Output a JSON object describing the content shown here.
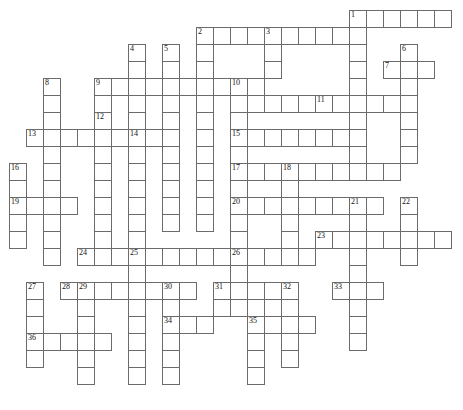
{
  "puzzle": {
    "title": "Crossword Puzzle Grid",
    "type": "crossword-grid",
    "cell_size": 17,
    "origin_x": 9,
    "origin_y": 10,
    "grid_columns": 27,
    "grid_rows": 24,
    "colors": {
      "cell_border": "#6b6b6b",
      "cell_fill": "#ffffff",
      "number_text": "#111111",
      "background": "#ffffff"
    },
    "clue_numbers": [
      1,
      2,
      3,
      4,
      5,
      6,
      7,
      8,
      9,
      10,
      11,
      12,
      13,
      14,
      15,
      16,
      17,
      18,
      19,
      20,
      21,
      22,
      23,
      24,
      25,
      26,
      27,
      28,
      29,
      30,
      31,
      32,
      33,
      34,
      35,
      36
    ],
    "entries": [
      {
        "number": 1,
        "direction": "across",
        "row": 0,
        "col": 20,
        "length": 6
      },
      {
        "number": 1,
        "direction": "down",
        "row": 0,
        "col": 20,
        "length": 8
      },
      {
        "number": 2,
        "direction": "across",
        "row": 1,
        "col": 11,
        "length": 9
      },
      {
        "number": 2,
        "direction": "down",
        "row": 1,
        "col": 11,
        "length": 8
      },
      {
        "number": 3,
        "direction": "down",
        "row": 1,
        "col": 15,
        "length": 3
      },
      {
        "number": 4,
        "direction": "down",
        "row": 2,
        "col": 7,
        "length": 5
      },
      {
        "number": 5,
        "direction": "down",
        "row": 2,
        "col": 9,
        "length": 8
      },
      {
        "number": 6,
        "direction": "down",
        "row": 2,
        "col": 23,
        "length": 8
      },
      {
        "number": 7,
        "direction": "across",
        "row": 3,
        "col": 22,
        "length": 3
      },
      {
        "number": 8,
        "direction": "down",
        "row": 4,
        "col": 2,
        "length": 12
      },
      {
        "number": 9,
        "direction": "across",
        "row": 4,
        "col": 5,
        "length": 10
      },
      {
        "number": 10,
        "direction": "across",
        "row": 4,
        "col": 13,
        "length": 5
      },
      {
        "number": 10,
        "direction": "down",
        "row": 4,
        "col": 13,
        "length": 14
      },
      {
        "number": 11,
        "direction": "across",
        "row": 5,
        "col": 18,
        "length": 5
      },
      {
        "number": 12,
        "direction": "down",
        "row": 6,
        "col": 5,
        "length": 12
      },
      {
        "number": 13,
        "direction": "across",
        "row": 7,
        "col": 1,
        "length": 8
      },
      {
        "number": 14,
        "direction": "down",
        "row": 7,
        "col": 7,
        "length": 7
      },
      {
        "number": 15,
        "direction": "across",
        "row": 7,
        "col": 13,
        "length": 7
      },
      {
        "number": 16,
        "direction": "down",
        "row": 9,
        "col": 0,
        "length": 4
      },
      {
        "number": 17,
        "direction": "across",
        "row": 9,
        "col": 13,
        "length": 10
      },
      {
        "number": 18,
        "direction": "down",
        "row": 9,
        "col": 16,
        "length": 7
      },
      {
        "number": 19,
        "direction": "across",
        "row": 11,
        "col": 0,
        "length": 4
      },
      {
        "number": 20,
        "direction": "across",
        "row": 11,
        "col": 13,
        "length": 8
      },
      {
        "number": 21,
        "direction": "down",
        "row": 11,
        "col": 20,
        "length": 8
      },
      {
        "number": 22,
        "direction": "down",
        "row": 11,
        "col": 23,
        "length": 5
      },
      {
        "number": 23,
        "direction": "across",
        "row": 13,
        "col": 18,
        "length": 8
      },
      {
        "number": 24,
        "direction": "across",
        "row": 14,
        "col": 4,
        "length": 10
      },
      {
        "number": 25,
        "direction": "down",
        "row": 14,
        "col": 7,
        "length": 10
      },
      {
        "number": 26,
        "direction": "across",
        "row": 14,
        "col": 13,
        "length": 5
      },
      {
        "number": 26,
        "direction": "down",
        "row": 14,
        "col": 13,
        "length": 6
      },
      {
        "number": 27,
        "direction": "down",
        "row": 16,
        "col": 1,
        "length": 6
      },
      {
        "number": 28,
        "direction": "across",
        "row": 16,
        "col": 3,
        "length": 8
      },
      {
        "number": 29,
        "direction": "down",
        "row": 16,
        "col": 4,
        "length": 8
      },
      {
        "number": 30,
        "direction": "down",
        "row": 16,
        "col": 9,
        "length": 8
      },
      {
        "number": 31,
        "direction": "across",
        "row": 16,
        "col": 12,
        "length": 4
      },
      {
        "number": 32,
        "direction": "down",
        "row": 16,
        "col": 16,
        "length": 6
      },
      {
        "number": 33,
        "direction": "across",
        "row": 16,
        "col": 19,
        "length": 3
      },
      {
        "number": 34,
        "direction": "across",
        "row": 18,
        "col": 9,
        "length": 3
      },
      {
        "number": 35,
        "direction": "across",
        "row": 18,
        "col": 14,
        "length": 4
      },
      {
        "number": 35,
        "direction": "down",
        "row": 18,
        "col": 14,
        "length": 5
      },
      {
        "number": 36,
        "direction": "across",
        "row": 19,
        "col": 1,
        "length": 5
      }
    ],
    "cells": [
      {
        "r": 0,
        "c": 20,
        "n": 1
      },
      {
        "r": 0,
        "c": 21
      },
      {
        "r": 0,
        "c": 22
      },
      {
        "r": 0,
        "c": 23
      },
      {
        "r": 0,
        "c": 24
      },
      {
        "r": 0,
        "c": 25
      },
      {
        "r": 1,
        "c": 11,
        "n": 2
      },
      {
        "r": 1,
        "c": 12
      },
      {
        "r": 1,
        "c": 13
      },
      {
        "r": 1,
        "c": 14
      },
      {
        "r": 1,
        "c": 15,
        "n": 3
      },
      {
        "r": 1,
        "c": 16
      },
      {
        "r": 1,
        "c": 17
      },
      {
        "r": 1,
        "c": 18
      },
      {
        "r": 1,
        "c": 19
      },
      {
        "r": 1,
        "c": 20
      },
      {
        "r": 2,
        "c": 7,
        "n": 4
      },
      {
        "r": 2,
        "c": 9,
        "n": 5
      },
      {
        "r": 2,
        "c": 11
      },
      {
        "r": 2,
        "c": 15
      },
      {
        "r": 2,
        "c": 20
      },
      {
        "r": 2,
        "c": 23,
        "n": 6
      },
      {
        "r": 3,
        "c": 7
      },
      {
        "r": 3,
        "c": 9
      },
      {
        "r": 3,
        "c": 11
      },
      {
        "r": 3,
        "c": 15
      },
      {
        "r": 3,
        "c": 20
      },
      {
        "r": 3,
        "c": 22,
        "n": 7
      },
      {
        "r": 3,
        "c": 23
      },
      {
        "r": 3,
        "c": 24
      },
      {
        "r": 4,
        "c": 2,
        "n": 8
      },
      {
        "r": 4,
        "c": 5,
        "n": 9
      },
      {
        "r": 4,
        "c": 6
      },
      {
        "r": 4,
        "c": 7
      },
      {
        "r": 4,
        "c": 8
      },
      {
        "r": 4,
        "c": 9
      },
      {
        "r": 4,
        "c": 10
      },
      {
        "r": 4,
        "c": 11
      },
      {
        "r": 4,
        "c": 12
      },
      {
        "r": 4,
        "c": 13,
        "n": 10
      },
      {
        "r": 4,
        "c": 14
      },
      {
        "r": 4,
        "c": 20
      },
      {
        "r": 4,
        "c": 23
      },
      {
        "r": 5,
        "c": 2
      },
      {
        "r": 5,
        "c": 5
      },
      {
        "r": 5,
        "c": 7
      },
      {
        "r": 5,
        "c": 9
      },
      {
        "r": 5,
        "c": 11
      },
      {
        "r": 5,
        "c": 13
      },
      {
        "r": 5,
        "c": 14
      },
      {
        "r": 5,
        "c": 15
      },
      {
        "r": 5,
        "c": 16
      },
      {
        "r": 5,
        "c": 17
      },
      {
        "r": 5,
        "c": 18,
        "n": 11
      },
      {
        "r": 5,
        "c": 19
      },
      {
        "r": 5,
        "c": 20
      },
      {
        "r": 5,
        "c": 21
      },
      {
        "r": 5,
        "c": 22
      },
      {
        "r": 5,
        "c": 23
      },
      {
        "r": 6,
        "c": 2
      },
      {
        "r": 6,
        "c": 5,
        "n": 12
      },
      {
        "r": 6,
        "c": 7
      },
      {
        "r": 6,
        "c": 9
      },
      {
        "r": 6,
        "c": 11
      },
      {
        "r": 6,
        "c": 13
      },
      {
        "r": 6,
        "c": 20
      },
      {
        "r": 6,
        "c": 23
      },
      {
        "r": 7,
        "c": 1,
        "n": 13
      },
      {
        "r": 7,
        "c": 2
      },
      {
        "r": 7,
        "c": 3
      },
      {
        "r": 7,
        "c": 4
      },
      {
        "r": 7,
        "c": 5
      },
      {
        "r": 7,
        "c": 6
      },
      {
        "r": 7,
        "c": 7,
        "n": 14
      },
      {
        "r": 7,
        "c": 8
      },
      {
        "r": 7,
        "c": 9
      },
      {
        "r": 7,
        "c": 11
      },
      {
        "r": 7,
        "c": 13,
        "n": 15
      },
      {
        "r": 7,
        "c": 14
      },
      {
        "r": 7,
        "c": 15
      },
      {
        "r": 7,
        "c": 16
      },
      {
        "r": 7,
        "c": 17
      },
      {
        "r": 7,
        "c": 18
      },
      {
        "r": 7,
        "c": 19
      },
      {
        "r": 7,
        "c": 20
      },
      {
        "r": 7,
        "c": 23
      },
      {
        "r": 8,
        "c": 2
      },
      {
        "r": 8,
        "c": 5
      },
      {
        "r": 8,
        "c": 7
      },
      {
        "r": 8,
        "c": 9
      },
      {
        "r": 8,
        "c": 11
      },
      {
        "r": 8,
        "c": 13
      },
      {
        "r": 8,
        "c": 20
      },
      {
        "r": 8,
        "c": 23
      },
      {
        "r": 9,
        "c": 0,
        "n": 16
      },
      {
        "r": 9,
        "c": 2
      },
      {
        "r": 9,
        "c": 5
      },
      {
        "r": 9,
        "c": 7
      },
      {
        "r": 9,
        "c": 9
      },
      {
        "r": 9,
        "c": 11
      },
      {
        "r": 9,
        "c": 13,
        "n": 17
      },
      {
        "r": 9,
        "c": 14
      },
      {
        "r": 9,
        "c": 15
      },
      {
        "r": 9,
        "c": 16,
        "n": 18
      },
      {
        "r": 9,
        "c": 17
      },
      {
        "r": 9,
        "c": 18
      },
      {
        "r": 9,
        "c": 19
      },
      {
        "r": 9,
        "c": 20
      },
      {
        "r": 9,
        "c": 21
      },
      {
        "r": 9,
        "c": 22
      },
      {
        "r": 10,
        "c": 0
      },
      {
        "r": 10,
        "c": 2
      },
      {
        "r": 10,
        "c": 5
      },
      {
        "r": 10,
        "c": 7
      },
      {
        "r": 10,
        "c": 9
      },
      {
        "r": 10,
        "c": 11
      },
      {
        "r": 10,
        "c": 13
      },
      {
        "r": 10,
        "c": 16
      },
      {
        "r": 11,
        "c": 0,
        "n": 19
      },
      {
        "r": 11,
        "c": 1
      },
      {
        "r": 11,
        "c": 2
      },
      {
        "r": 11,
        "c": 3
      },
      {
        "r": 11,
        "c": 5
      },
      {
        "r": 11,
        "c": 7
      },
      {
        "r": 11,
        "c": 9
      },
      {
        "r": 11,
        "c": 11
      },
      {
        "r": 11,
        "c": 13,
        "n": 20
      },
      {
        "r": 11,
        "c": 14
      },
      {
        "r": 11,
        "c": 15
      },
      {
        "r": 11,
        "c": 16
      },
      {
        "r": 11,
        "c": 17
      },
      {
        "r": 11,
        "c": 18
      },
      {
        "r": 11,
        "c": 19
      },
      {
        "r": 11,
        "c": 20,
        "n": 21
      },
      {
        "r": 11,
        "c": 21
      },
      {
        "r": 11,
        "c": 23,
        "n": 22
      },
      {
        "r": 12,
        "c": 0
      },
      {
        "r": 12,
        "c": 2
      },
      {
        "r": 12,
        "c": 5
      },
      {
        "r": 12,
        "c": 7
      },
      {
        "r": 12,
        "c": 9
      },
      {
        "r": 12,
        "c": 11
      },
      {
        "r": 12,
        "c": 13
      },
      {
        "r": 12,
        "c": 16
      },
      {
        "r": 12,
        "c": 20
      },
      {
        "r": 12,
        "c": 23
      },
      {
        "r": 13,
        "c": 0
      },
      {
        "r": 13,
        "c": 2
      },
      {
        "r": 13,
        "c": 5
      },
      {
        "r": 13,
        "c": 7
      },
      {
        "r": 13,
        "c": 13
      },
      {
        "r": 13,
        "c": 16
      },
      {
        "r": 13,
        "c": 18,
        "n": 23
      },
      {
        "r": 13,
        "c": 19
      },
      {
        "r": 13,
        "c": 20
      },
      {
        "r": 13,
        "c": 21
      },
      {
        "r": 13,
        "c": 22
      },
      {
        "r": 13,
        "c": 23
      },
      {
        "r": 13,
        "c": 24
      },
      {
        "r": 13,
        "c": 25
      },
      {
        "r": 14,
        "c": 2
      },
      {
        "r": 14,
        "c": 4,
        "n": 24
      },
      {
        "r": 14,
        "c": 5
      },
      {
        "r": 14,
        "c": 6
      },
      {
        "r": 14,
        "c": 7,
        "n": 25
      },
      {
        "r": 14,
        "c": 8
      },
      {
        "r": 14,
        "c": 9
      },
      {
        "r": 14,
        "c": 10
      },
      {
        "r": 14,
        "c": 11
      },
      {
        "r": 14,
        "c": 12
      },
      {
        "r": 14,
        "c": 13,
        "n": 26
      },
      {
        "r": 14,
        "c": 14
      },
      {
        "r": 14,
        "c": 15
      },
      {
        "r": 14,
        "c": 16
      },
      {
        "r": 14,
        "c": 17
      },
      {
        "r": 14,
        "c": 20
      },
      {
        "r": 14,
        "c": 23
      },
      {
        "r": 15,
        "c": 7
      },
      {
        "r": 15,
        "c": 13
      },
      {
        "r": 15,
        "c": 20
      },
      {
        "r": 16,
        "c": 1,
        "n": 27
      },
      {
        "r": 16,
        "c": 3,
        "n": 28
      },
      {
        "r": 16,
        "c": 4,
        "n": 29
      },
      {
        "r": 16,
        "c": 5
      },
      {
        "r": 16,
        "c": 6
      },
      {
        "r": 16,
        "c": 7
      },
      {
        "r": 16,
        "c": 8
      },
      {
        "r": 16,
        "c": 9,
        "n": 30
      },
      {
        "r": 16,
        "c": 10
      },
      {
        "r": 16,
        "c": 12,
        "n": 31
      },
      {
        "r": 16,
        "c": 13
      },
      {
        "r": 16,
        "c": 14
      },
      {
        "r": 16,
        "c": 15
      },
      {
        "r": 16,
        "c": 16,
        "n": 32
      },
      {
        "r": 16,
        "c": 19,
        "n": 33
      },
      {
        "r": 16,
        "c": 20
      },
      {
        "r": 16,
        "c": 21
      },
      {
        "r": 17,
        "c": 1
      },
      {
        "r": 17,
        "c": 4
      },
      {
        "r": 17,
        "c": 7
      },
      {
        "r": 17,
        "c": 9
      },
      {
        "r": 17,
        "c": 12
      },
      {
        "r": 17,
        "c": 13
      },
      {
        "r": 17,
        "c": 14
      },
      {
        "r": 17,
        "c": 16
      },
      {
        "r": 17,
        "c": 20
      },
      {
        "r": 18,
        "c": 1
      },
      {
        "r": 18,
        "c": 4
      },
      {
        "r": 18,
        "c": 7
      },
      {
        "r": 18,
        "c": 9,
        "n": 34
      },
      {
        "r": 18,
        "c": 10
      },
      {
        "r": 18,
        "c": 11
      },
      {
        "r": 18,
        "c": 14,
        "n": 35
      },
      {
        "r": 18,
        "c": 15
      },
      {
        "r": 18,
        "c": 16
      },
      {
        "r": 18,
        "c": 17
      },
      {
        "r": 18,
        "c": 20
      },
      {
        "r": 19,
        "c": 1,
        "n": 36
      },
      {
        "r": 19,
        "c": 2
      },
      {
        "r": 19,
        "c": 3
      },
      {
        "r": 19,
        "c": 4
      },
      {
        "r": 19,
        "c": 5
      },
      {
        "r": 19,
        "c": 7
      },
      {
        "r": 19,
        "c": 9
      },
      {
        "r": 19,
        "c": 14
      },
      {
        "r": 19,
        "c": 16
      },
      {
        "r": 19,
        "c": 20
      },
      {
        "r": 20,
        "c": 1
      },
      {
        "r": 20,
        "c": 4
      },
      {
        "r": 20,
        "c": 7
      },
      {
        "r": 20,
        "c": 9
      },
      {
        "r": 20,
        "c": 14
      },
      {
        "r": 20,
        "c": 16
      },
      {
        "r": 21,
        "c": 4
      },
      {
        "r": 21,
        "c": 7
      },
      {
        "r": 21,
        "c": 9
      },
      {
        "r": 21,
        "c": 14
      }
    ]
  }
}
